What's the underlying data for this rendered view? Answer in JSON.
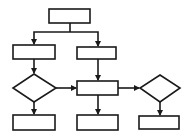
{
  "diagram": {
    "type": "flowchart",
    "stroke_color": "#1a1a1a",
    "background": "#ffffff",
    "nodes": [
      {
        "id": "top",
        "shape": "rect",
        "label": ""
      },
      {
        "id": "left-process",
        "shape": "rect",
        "label": ""
      },
      {
        "id": "center-process",
        "shape": "rect",
        "label": ""
      },
      {
        "id": "left-decision",
        "shape": "diamond",
        "label": ""
      },
      {
        "id": "center-main",
        "shape": "rect",
        "label": ""
      },
      {
        "id": "right-decision",
        "shape": "diamond",
        "label": ""
      },
      {
        "id": "bottom-left",
        "shape": "rect",
        "label": ""
      },
      {
        "id": "bottom-center",
        "shape": "rect",
        "label": ""
      },
      {
        "id": "bottom-right",
        "shape": "rect",
        "label": ""
      }
    ],
    "edges": [
      {
        "from": "top",
        "to": "left-process"
      },
      {
        "from": "top",
        "to": "center-process"
      },
      {
        "from": "left-process",
        "to": "left-decision"
      },
      {
        "from": "center-process",
        "to": "center-main"
      },
      {
        "from": "left-decision",
        "to": "center-main"
      },
      {
        "from": "left-decision",
        "to": "bottom-left"
      },
      {
        "from": "center-main",
        "to": "right-decision"
      },
      {
        "from": "center-main",
        "to": "bottom-center"
      },
      {
        "from": "right-decision",
        "to": "bottom-right"
      }
    ]
  }
}
